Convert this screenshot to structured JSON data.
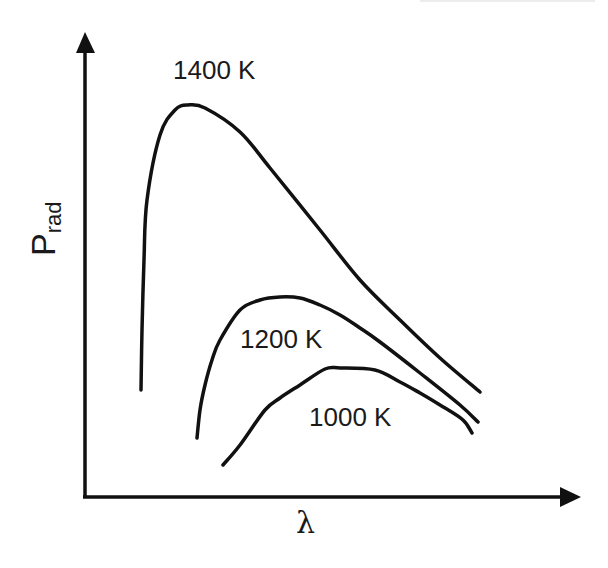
{
  "chart_data": {
    "type": "line",
    "title": "",
    "xlabel": "λ",
    "ylabel": "P",
    "ylabel_subscript": "rad",
    "grid": false,
    "legend": "none (inline curve labels)",
    "axes": {
      "x_arrow": true,
      "y_arrow": true,
      "ticks": false
    },
    "series": [
      {
        "name": "1400 K",
        "label": "1400 K",
        "points": [
          [
            141,
            390
          ],
          [
            142,
            330
          ],
          [
            144,
            260
          ],
          [
            147,
            200
          ],
          [
            160,
            135
          ],
          [
            175,
            110
          ],
          [
            188,
            105
          ],
          [
            205,
            108
          ],
          [
            240,
            132
          ],
          [
            270,
            168
          ],
          [
            320,
            230
          ],
          [
            360,
            280
          ],
          [
            400,
            320
          ],
          [
            440,
            358
          ],
          [
            480,
            392
          ]
        ]
      },
      {
        "name": "1200 K",
        "label": "1200 K",
        "points": [
          [
            197,
            438
          ],
          [
            200,
            410
          ],
          [
            205,
            385
          ],
          [
            212,
            360
          ],
          [
            220,
            340
          ],
          [
            240,
            310
          ],
          [
            260,
            300
          ],
          [
            280,
            297
          ],
          [
            300,
            298
          ],
          [
            320,
            305
          ],
          [
            340,
            315
          ],
          [
            360,
            328
          ],
          [
            380,
            342
          ],
          [
            420,
            373
          ],
          [
            460,
            405
          ],
          [
            478,
            422
          ]
        ]
      },
      {
        "name": "1000 K",
        "label": "1000 K",
        "points": [
          [
            223,
            465
          ],
          [
            240,
            445
          ],
          [
            265,
            410
          ],
          [
            280,
            398
          ],
          [
            300,
            385
          ],
          [
            325,
            369
          ],
          [
            340,
            368
          ],
          [
            375,
            370
          ],
          [
            400,
            382
          ],
          [
            420,
            393
          ],
          [
            440,
            405
          ],
          [
            463,
            420
          ],
          [
            472,
            433
          ]
        ]
      }
    ],
    "note": "Qualitative blackbody radiation curves; points are pixel coordinates (no numeric axis scale shown)."
  },
  "labels": {
    "curve_1400": "1400 K",
    "curve_1200": "1200 K",
    "curve_1000": "1000 K",
    "y_axis_main": "P",
    "y_axis_sub": "rad",
    "x_axis": "λ"
  },
  "colors": {
    "ink": "#1a1a1a",
    "background": "#ffffff"
  }
}
